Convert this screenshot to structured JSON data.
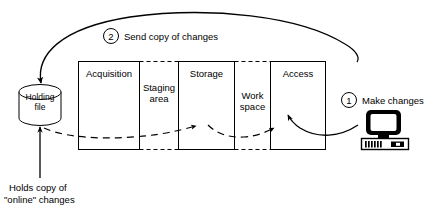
{
  "diagram": {
    "type": "data-flow-diagram",
    "background_color": "#ffffff",
    "line_color": "#000000",
    "store": {
      "name": "holding-file",
      "label": "Holding\nfile",
      "shape": "cylinder"
    },
    "stages": [
      {
        "id": "acquisition",
        "label": "Acquisition",
        "border": "solid",
        "label_lines": 1
      },
      {
        "id": "staging-area",
        "label": "Staging\narea",
        "border": "dashed",
        "label_lines": 2
      },
      {
        "id": "storage",
        "label": "Storage",
        "border": "solid",
        "label_lines": 1
      },
      {
        "id": "work-space",
        "label": "Work\nspace",
        "border": "dashed",
        "label_lines": 2
      },
      {
        "id": "access",
        "label": "Access",
        "border": "solid",
        "label_lines": 1
      }
    ],
    "annotations": [
      {
        "id": "make-changes",
        "number": "1",
        "label": "Make changes"
      },
      {
        "id": "send-copy-of-changes",
        "number": "2",
        "label": "Send copy of changes"
      }
    ],
    "caption": {
      "id": "holds-copy-caption",
      "line1": "Holds copy of",
      "line2": "\"online\" changes"
    },
    "terminal": {
      "id": "computer-terminal",
      "icon": "desktop-computer-icon"
    }
  }
}
